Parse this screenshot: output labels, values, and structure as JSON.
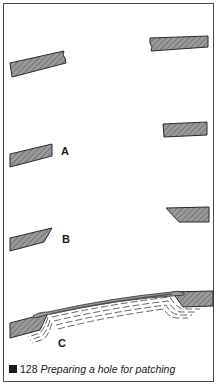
{
  "figure": {
    "number": "128",
    "caption": "Preparing a hole for patching",
    "labels": {
      "a": "A",
      "b": "B",
      "c": "C"
    },
    "colors": {
      "hatch_fill": "#8a8a8a",
      "outline": "#2a2a2a",
      "frame": "#4a4a4a"
    },
    "stages": [
      {
        "id": "initial",
        "description": "Ragged edges of hole in sheet material"
      },
      {
        "id": "A",
        "description": "Edges trimmed square"
      },
      {
        "id": "B",
        "description": "Edges bevelled"
      },
      {
        "id": "C",
        "description": "Patch laid over bevelled edges with filler layers"
      }
    ]
  }
}
